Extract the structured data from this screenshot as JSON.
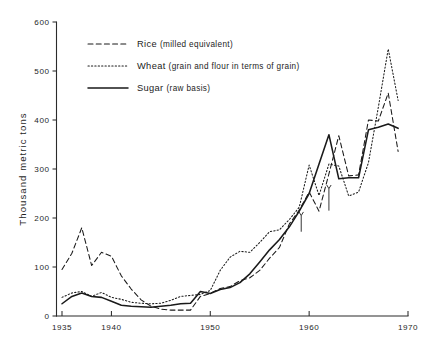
{
  "chart_data": {
    "type": "line",
    "title": "",
    "subtitle": "",
    "xlabel": "",
    "ylabel": "Thousand metric tons",
    "xlim": [
      1935,
      1970
    ],
    "ylim": [
      0,
      600
    ],
    "grid": false,
    "legend_position": "top-center",
    "x_ticks": [
      1935,
      1940,
      1950,
      1960,
      1970
    ],
    "x_tick_labels": [
      "1935",
      "1940",
      "1950",
      "1960",
      "1970"
    ],
    "x_minor_ticks": [
      1936,
      1937,
      1938,
      1939,
      1941,
      1942,
      1943,
      1944,
      1945,
      1946,
      1947,
      1948,
      1949,
      1951,
      1952,
      1953,
      1954,
      1955,
      1956,
      1957,
      1958,
      1959,
      1961,
      1962,
      1963,
      1964,
      1965,
      1966,
      1967,
      1968,
      1969
    ],
    "y_ticks": [
      0,
      100,
      200,
      300,
      400,
      500,
      600
    ],
    "y_tick_labels": [
      "0",
      "100",
      "200",
      "300",
      "400",
      "500",
      "600"
    ],
    "annotations": [
      {
        "kind": "down-arrow",
        "x": 1959.2,
        "y_from": 205,
        "y_to": 172,
        "note": ""
      },
      {
        "kind": "down-arrow",
        "x": 1962.0,
        "y_from": 260,
        "y_to": 215,
        "note": ""
      }
    ],
    "series": [
      {
        "name": "Rice",
        "qualifier": "(milled equivalent)",
        "style": "dashed",
        "color": "#1a1a1a",
        "x": [
          1935,
          1936,
          1937,
          1938,
          1939,
          1940,
          1941,
          1942,
          1943,
          1944,
          1945,
          1946,
          1947,
          1948,
          1949,
          1950,
          1951,
          1952,
          1953,
          1954,
          1955,
          1956,
          1957,
          1958,
          1959,
          1960,
          1961,
          1962,
          1963,
          1964,
          1965,
          1966,
          1967,
          1968,
          1969
        ],
        "values": [
          95,
          128,
          180,
          103,
          130,
          122,
          82,
          55,
          33,
          20,
          14,
          12,
          12,
          12,
          40,
          46,
          56,
          60,
          72,
          78,
          93,
          118,
          140,
          188,
          216,
          253,
          214,
          290,
          368,
          286,
          288,
          400,
          398,
          455,
          336
        ]
      },
      {
        "name": "Wheat",
        "qualifier": "(grain and flour in terms of grain)",
        "style": "dotted",
        "color": "#1a1a1a",
        "x": [
          1935,
          1936,
          1937,
          1938,
          1939,
          1940,
          1941,
          1942,
          1943,
          1944,
          1945,
          1946,
          1947,
          1948,
          1949,
          1950,
          1951,
          1952,
          1953,
          1954,
          1955,
          1956,
          1957,
          1958,
          1959,
          1960,
          1961,
          1962,
          1963,
          1964,
          1965,
          1966,
          1967,
          1968,
          1969
        ],
        "values": [
          38,
          47,
          50,
          40,
          48,
          38,
          34,
          28,
          26,
          25,
          26,
          32,
          40,
          42,
          44,
          52,
          93,
          120,
          132,
          130,
          150,
          172,
          176,
          197,
          222,
          308,
          246,
          310,
          306,
          245,
          253,
          313,
          426,
          545,
          440
        ]
      },
      {
        "name": "Sugar",
        "qualifier": "(raw basis)",
        "style": "solid",
        "color": "#1a1a1a",
        "x": [
          1935,
          1936,
          1937,
          1938,
          1939,
          1940,
          1941,
          1942,
          1943,
          1944,
          1945,
          1946,
          1947,
          1948,
          1949,
          1950,
          1951,
          1952,
          1953,
          1954,
          1955,
          1956,
          1957,
          1958,
          1959,
          1960,
          1961,
          1962,
          1963,
          1964,
          1965,
          1966,
          1967,
          1968,
          1969
        ],
        "values": [
          25,
          40,
          47,
          40,
          38,
          30,
          22,
          20,
          19,
          18,
          20,
          22,
          25,
          26,
          50,
          46,
          54,
          58,
          68,
          86,
          110,
          135,
          156,
          182,
          214,
          250,
          310,
          370,
          280,
          282,
          282,
          380,
          385,
          392,
          383
        ]
      }
    ]
  },
  "legend": {
    "entries": [
      {
        "name": "Rice",
        "qualifier": "(milled equivalent)"
      },
      {
        "name": "Wheat",
        "qualifier": "(grain and flour in terms of grain)"
      },
      {
        "name": "Sugar",
        "qualifier": "(raw basis)"
      }
    ]
  },
  "axes": {
    "y_title": "Thousand metric tons"
  }
}
